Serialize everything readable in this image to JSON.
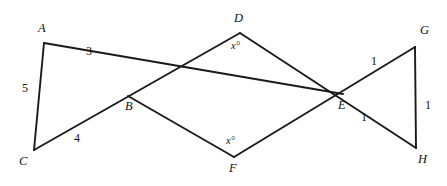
{
  "figure": {
    "stroke_color": "#1a1a1a",
    "background_color": "#ffffff",
    "width": 447,
    "height": 186,
    "vertices": [
      {
        "id": "A",
        "label": "A",
        "x": 44,
        "y": 43,
        "label_x": 38,
        "label_y": 22
      },
      {
        "id": "B",
        "label": "B",
        "x": 128,
        "y": 96,
        "label_x": 125,
        "label_y": 100
      },
      {
        "id": "C",
        "label": "C",
        "x": 34,
        "y": 150,
        "label_x": 19,
        "label_y": 155
      },
      {
        "id": "D",
        "label": "D",
        "x": 240,
        "y": 33,
        "label_x": 234,
        "label_y": 12
      },
      {
        "id": "E",
        "label": "E",
        "x": 343,
        "y": 94,
        "label_x": 338,
        "label_y": 99
      },
      {
        "id": "F",
        "label": "F",
        "x": 234,
        "y": 157,
        "label_x": 229,
        "label_y": 162
      },
      {
        "id": "G",
        "label": "G",
        "x": 415,
        "y": 47,
        "label_x": 420,
        "label_y": 24
      },
      {
        "id": "H",
        "label": "H",
        "x": 416,
        "y": 148,
        "label_x": 418,
        "label_y": 153
      }
    ],
    "segments": [
      {
        "id": "A-C",
        "name": "segment-ac",
        "x1": 44,
        "y1": 43,
        "x2": 34,
        "y2": 150
      },
      {
        "id": "A-E",
        "name": "segment-ae",
        "x1": 44,
        "y1": 43,
        "x2": 343,
        "y2": 94
      },
      {
        "id": "C-D",
        "name": "segment-cd",
        "x1": 34,
        "y1": 150,
        "x2": 240,
        "y2": 33
      },
      {
        "id": "D-H",
        "name": "segment-dh",
        "x1": 240,
        "y1": 33,
        "x2": 416,
        "y2": 148
      },
      {
        "id": "F-G",
        "name": "segment-fg",
        "x1": 234,
        "y1": 157,
        "x2": 415,
        "y2": 47
      },
      {
        "id": "B-F",
        "name": "segment-bf",
        "x1": 128,
        "y1": 96,
        "x2": 234,
        "y2": 157
      },
      {
        "id": "G-H",
        "name": "segment-gh",
        "x1": 415,
        "y1": 47,
        "x2": 416,
        "y2": 148
      }
    ],
    "length_labels": [
      {
        "id": "len-ac",
        "name": "length-label-ac",
        "text": "5",
        "x": 22,
        "y": 82
      },
      {
        "id": "len-ab",
        "name": "length-label-ab",
        "text": "3",
        "x": 86,
        "y": 45
      },
      {
        "id": "len-cb",
        "name": "length-label-cb",
        "text": "4",
        "x": 74,
        "y": 132
      },
      {
        "id": "len-eg",
        "name": "length-label-eg",
        "text": "1",
        "x": 371,
        "y": 55
      },
      {
        "id": "len-gh",
        "name": "length-label-gh",
        "text": "1",
        "x": 425,
        "y": 99
      },
      {
        "id": "len-eh",
        "name": "length-label-eh",
        "text": "1",
        "x": 361,
        "y": 111
      }
    ],
    "angle_labels": [
      {
        "id": "angle-d",
        "name": "angle-label-d",
        "text": "x°",
        "x": 231,
        "y": 41
      },
      {
        "id": "angle-f",
        "name": "angle-label-f",
        "text": "x°",
        "x": 226,
        "y": 136
      }
    ]
  }
}
